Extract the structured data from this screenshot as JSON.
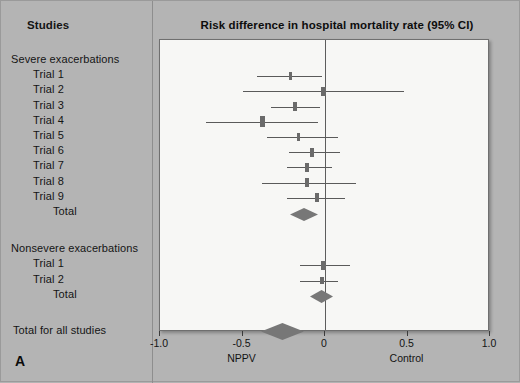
{
  "figure": {
    "panel_letter": "A",
    "background_color": "#b4b4b4",
    "plot_background_color": "#f7f7f5",
    "marker_color": "#6a6a6a",
    "diamond_color": "#777777"
  },
  "labels_column": {
    "header": "Studies",
    "groups": [
      {
        "title": "Severe exacerbations",
        "rows": [
          "Trial 1",
          "Trial 2",
          "Trial 3",
          "Trial 4",
          "Trial 5",
          "Trial 6",
          "Trial 7",
          "Trial 8",
          "Trial 9"
        ],
        "total_label": "Total"
      },
      {
        "title": "Nonsevere exacerbations",
        "rows": [
          "Trial 1",
          "Trial 2"
        ],
        "total_label": "Total"
      }
    ],
    "overall_label": "Total for all studies"
  },
  "chart_data": {
    "type": "forest",
    "title": "Risk difference in hospital mortality rate (95% CI)",
    "xlabel": "",
    "ylabel": "",
    "xlim": [
      -1.0,
      1.0
    ],
    "xticks": [
      -1.0,
      -0.5,
      0,
      0.5,
      1.0
    ],
    "xticklabels": [
      "-1.0",
      "-0.5",
      "0",
      "0.5",
      "1.0"
    ],
    "grid": false,
    "legend": "none",
    "reference_line": 0,
    "axis_side_labels": [
      {
        "text": "NPPV",
        "at": -0.5
      },
      {
        "text": "Control",
        "at": 0.5
      }
    ],
    "groups": [
      {
        "name": "Severe exacerbations",
        "studies": [
          {
            "label": "Trial 1",
            "estimate": -0.21,
            "ci_low": -0.41,
            "ci_high": -0.02,
            "weight": 1
          },
          {
            "label": "Trial 2",
            "estimate": -0.01,
            "ci_low": -0.5,
            "ci_high": 0.48,
            "weight": 2
          },
          {
            "label": "Trial 3",
            "estimate": -0.18,
            "ci_low": -0.33,
            "ci_high": -0.03,
            "weight": 2
          },
          {
            "label": "Trial 4",
            "estimate": -0.38,
            "ci_low": -0.72,
            "ci_high": -0.04,
            "weight": 3
          },
          {
            "label": "Trial 5",
            "estimate": -0.16,
            "ci_low": -0.35,
            "ci_high": 0.08,
            "weight": 1
          },
          {
            "label": "Trial 6",
            "estimate": -0.08,
            "ci_low": -0.22,
            "ci_high": 0.09,
            "weight": 2
          },
          {
            "label": "Trial 7",
            "estimate": -0.11,
            "ci_low": -0.23,
            "ci_high": 0.04,
            "weight": 2
          },
          {
            "label": "Trial 8",
            "estimate": -0.11,
            "ci_low": -0.38,
            "ci_high": 0.19,
            "weight": 2
          },
          {
            "label": "Trial 9",
            "estimate": -0.05,
            "ci_low": -0.23,
            "ci_high": 0.12,
            "weight": 2
          }
        ],
        "summary": {
          "label": "Total",
          "estimate": -0.13,
          "ci_low": -0.22,
          "ci_high": -0.05
        }
      },
      {
        "name": "Nonsevere exacerbations",
        "studies": [
          {
            "label": "Trial 1",
            "estimate": -0.01,
            "ci_low": -0.15,
            "ci_high": 0.15,
            "weight": 2
          },
          {
            "label": "Trial 2",
            "estimate": -0.02,
            "ci_low": -0.15,
            "ci_high": 0.08,
            "weight": 1
          }
        ],
        "summary": {
          "label": "Total",
          "estimate": -0.02,
          "ci_low": -0.09,
          "ci_high": 0.05
        }
      }
    ],
    "overall_summary": {
      "label": "Total for all studies",
      "estimate": -0.26,
      "ci_low": -0.39,
      "ci_high": -0.13
    }
  }
}
